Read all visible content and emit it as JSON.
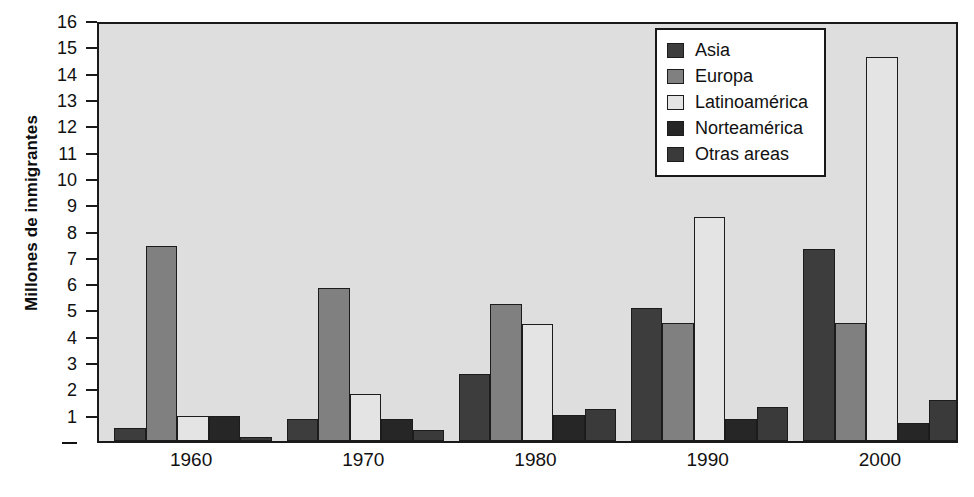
{
  "chart_data": {
    "type": "bar",
    "title": "",
    "subtitle": "",
    "xlabel": "",
    "ylabel": "Millones de inmigrantes",
    "ylim": [
      0,
      16
    ],
    "ytick_labels": [
      "16",
      "15",
      "14",
      "13",
      "12",
      "11",
      "10",
      "9",
      "8",
      "7",
      "6",
      "5",
      "4",
      "3",
      "2",
      "1",
      "–"
    ],
    "ytick_values": [
      16,
      15,
      14,
      13,
      12,
      11,
      10,
      9,
      8,
      7,
      6,
      5,
      4,
      3,
      2,
      1,
      0
    ],
    "grid": false,
    "legend_position": "top-right",
    "categories": [
      "1960",
      "1970",
      "1980",
      "1990",
      "2000"
    ],
    "series": [
      {
        "name": "Asia",
        "color": "#3d3d3d",
        "values": [
          0.5,
          0.85,
          2.55,
          5.05,
          7.3
        ]
      },
      {
        "name": "Europa",
        "color": "#808080",
        "values": [
          7.4,
          5.8,
          5.2,
          4.5,
          4.5
        ]
      },
      {
        "name": "Latinoamérica",
        "color": "#e4e4e4",
        "values": [
          0.95,
          1.8,
          4.45,
          8.5,
          14.6
        ]
      },
      {
        "name": "Norteamérica",
        "color": "#262626",
        "values": [
          0.95,
          0.85,
          1.0,
          0.85,
          0.7
        ]
      },
      {
        "name": "Otras areas",
        "color": "#3a3a3a",
        "values": [
          0.15,
          0.4,
          1.2,
          1.3,
          1.55
        ]
      }
    ]
  },
  "legend": {
    "items": [
      {
        "label": "Asia",
        "color": "#3d3d3d"
      },
      {
        "label": "Europa",
        "color": "#808080"
      },
      {
        "label": "Latinoamérica",
        "color": "#e4e4e4"
      },
      {
        "label": "Norteamérica",
        "color": "#262626"
      },
      {
        "label": "Otras areas",
        "color": "#3a3a3a"
      }
    ]
  },
  "style": {
    "plot_background": "#dedede",
    "page_background": "#ffffff",
    "frame_color": "#1a1a1a",
    "text_color": "#111111"
  }
}
